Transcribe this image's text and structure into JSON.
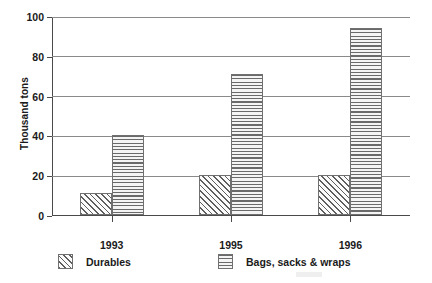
{
  "chart_data": {
    "type": "bar",
    "title": "",
    "xlabel": "",
    "ylabel": "Thousand tons",
    "categories": [
      "1993",
      "1995",
      "1996"
    ],
    "series": [
      {
        "name": "Durables",
        "values": [
          11,
          20,
          20
        ],
        "hatch": "diagonal",
        "color": "#5e5e5e"
      },
      {
        "name": "Bags, sacks & wraps",
        "values": [
          40,
          71,
          94
        ],
        "hatch": "horizontal",
        "color": "#6a6a6a"
      }
    ],
    "ylim": [
      0,
      100
    ],
    "yticks": [
      "0",
      "20",
      "40",
      "60",
      "80",
      "100"
    ],
    "ytick_values": [
      0,
      20,
      40,
      60,
      80,
      100
    ],
    "grid": true,
    "legend_position": "bottom"
  },
  "legend": {
    "entries": [
      {
        "label": "Durables"
      },
      {
        "label": "Bags, sacks & wraps"
      }
    ]
  }
}
